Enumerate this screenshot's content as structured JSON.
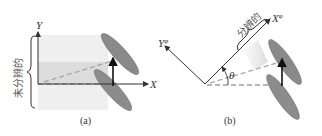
{
  "panels": [
    {
      "caption": "(a)",
      "axis_x": "X",
      "axis_y": "Y",
      "brace_label": "未分辨的"
    },
    {
      "caption": "(b)",
      "axis_x": "X",
      "axis_x_sup": "φ",
      "axis_y": "Y",
      "axis_y_sup": "φ",
      "angle_label": "θ",
      "brace_label": "分辨的"
    }
  ],
  "colors": {
    "axis": "#333333",
    "ellipse_fill": "#8a8a8a",
    "ellipse_stroke": "#666666",
    "band_light": "#ededed",
    "band_dark": "#dcdcdc",
    "dash": "#a8a8a8",
    "arrow": "#111111"
  }
}
